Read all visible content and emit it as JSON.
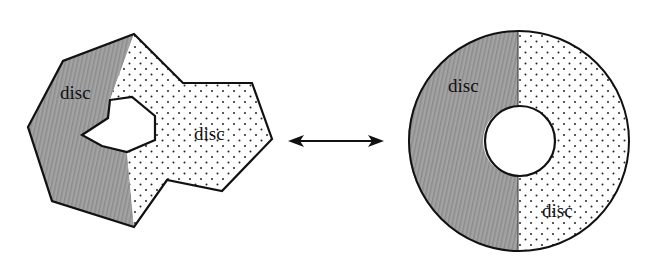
{
  "diagram": {
    "left_shape": {
      "label_dark": "disc",
      "label_dotted": "disc"
    },
    "arrow": {
      "direction": "bidirectional"
    },
    "right_shape": {
      "label_dark": "disc",
      "label_dotted": "disc"
    },
    "colors": {
      "dark_fill": "#9a9a9a",
      "stroke": "#111111",
      "dot": "#222222",
      "background": "#ffffff"
    }
  }
}
